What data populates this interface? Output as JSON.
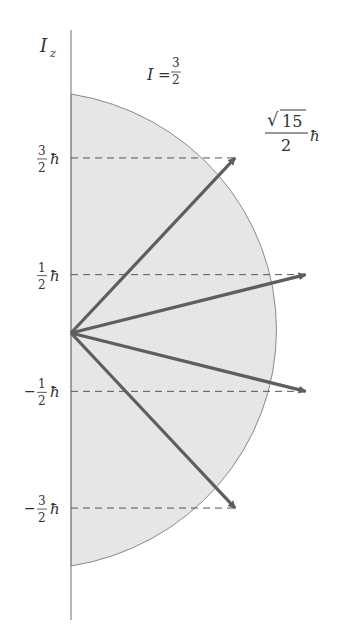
{
  "title": {
    "axis_label": "I",
    "axis_sub": "z",
    "spin_label": "I",
    "spin_eq": "=",
    "spin_num": "3",
    "spin_den": "2"
  },
  "magnitude_label": {
    "num": "15",
    "den": "2",
    "hbar": "ħ",
    "sqrt": "√"
  },
  "levels": [
    {
      "m": 1.5,
      "sign": "",
      "num": "3",
      "den": "2",
      "hbar": "ħ"
    },
    {
      "m": 0.5,
      "sign": "",
      "num": "1",
      "den": "2",
      "hbar": "ħ"
    },
    {
      "m": -0.5,
      "sign": "−",
      "num": "1",
      "den": "2",
      "hbar": "ħ"
    },
    {
      "m": -1.5,
      "sign": "−",
      "num": "3",
      "den": "2",
      "hbar": "ħ"
    }
  ],
  "colors": {
    "fill": "#e6e6e6",
    "arrow": "#5e5e5e",
    "axis": "#888888",
    "dash": "#555555",
    "outline": "#8a8a8a"
  }
}
